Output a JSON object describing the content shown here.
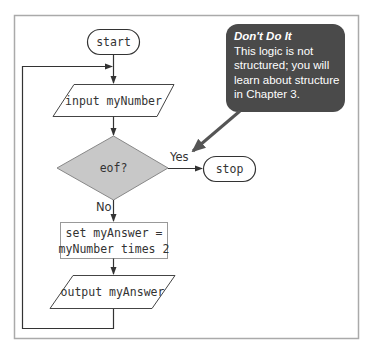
{
  "flowchart": {
    "start_label": "start",
    "input_label": "input myNumber",
    "decision_label": "eof?",
    "yes_label": "Yes",
    "no_label": "No",
    "stop_label": "stop",
    "process_line1": "set myAnswer =",
    "process_line2": "myNumber times 2",
    "output_label": "output myAnswer"
  },
  "callout": {
    "title": "Don't Do It",
    "body": "This logic is not structured; you will learn about structure in Chapter 3."
  },
  "colors": {
    "callout_bg": "#4a4a4a",
    "decision_fill": "#c8c8c8",
    "frame": "#aaaaaa",
    "line": "#333333"
  }
}
